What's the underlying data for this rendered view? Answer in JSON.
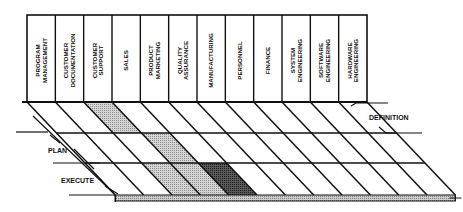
{
  "diagram": {
    "type": "functional-phase-matrix",
    "columns": [
      {
        "line1": "PROGRAM",
        "line2": "MANAGEMENT"
      },
      {
        "line1": "CUSTOMER",
        "line2": "DOCUMENTATION"
      },
      {
        "line1": "CUSTOMER",
        "line2": "SUPPORT"
      },
      {
        "line1": "SALES",
        "line2": ""
      },
      {
        "line1": "PRODUCT",
        "line2": "MARKETING"
      },
      {
        "line1": "QUALITY",
        "line2": "ASSURANCE"
      },
      {
        "line1": "MANUFACTURING",
        "line2": ""
      },
      {
        "line1": "PERSONNEL",
        "line2": ""
      },
      {
        "line1": "FINANCE",
        "line2": ""
      },
      {
        "line1": "SYSTEM",
        "line2": "ENGINEERING"
      },
      {
        "line1": "SOFTWARE",
        "line2": "ENGINEERING"
      },
      {
        "line1": "HARDWARE",
        "line2": "ENGINEERING"
      }
    ],
    "phases": [
      {
        "label": "DEFINITION",
        "side": "right"
      },
      {
        "label": "PLAN",
        "side": "left"
      },
      {
        "label": "EXECUTE",
        "side": "left"
      }
    ],
    "shaded_cells": [
      {
        "phase": "DEFINITION",
        "column": "CUSTOMER SUPPORT",
        "shade": "light"
      },
      {
        "phase": "PLAN",
        "column": "SALES",
        "shade": "light"
      },
      {
        "phase": "EXECUTE",
        "column": "CUSTOMER SUPPORT",
        "shade": "light"
      },
      {
        "phase": "EXECUTE",
        "column": "SALES",
        "shade": "light"
      },
      {
        "phase": "EXECUTE",
        "column": "PRODUCT MARKETING",
        "shade": "dark"
      }
    ],
    "colors": {
      "line": "#111111",
      "light_shade": "#bdbdbd",
      "dark_shade": "#4a4a4a",
      "slab": "#b0b0b0",
      "background": "#ffffff"
    }
  }
}
